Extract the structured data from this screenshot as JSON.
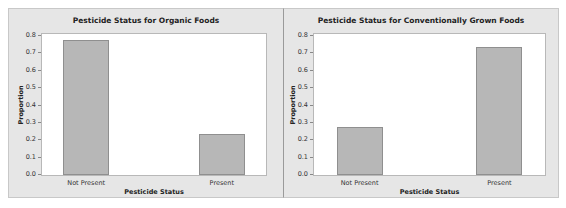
{
  "chart_data": [
    {
      "type": "bar",
      "title": "Pesticide Status for Organic Foods",
      "xlabel": "Pesticide Status",
      "ylabel": "Proportion",
      "categories": [
        "Not Present",
        "Present"
      ],
      "values": [
        0.77,
        0.23
      ],
      "ylim": [
        0.0,
        0.8
      ],
      "yticks": [
        "0.0",
        "0.1",
        "0.2",
        "0.3",
        "0.4",
        "0.5",
        "0.6",
        "0.7",
        "0.8"
      ],
      "grid": false,
      "legend": "none",
      "bar_color": "#b7b7b7"
    },
    {
      "type": "bar",
      "title": "Pesticide Status for Conventionally Grown Foods",
      "xlabel": "Pesticide Status",
      "ylabel": "Proportion",
      "categories": [
        "Not Present",
        "Present"
      ],
      "values": [
        0.27,
        0.73
      ],
      "ylim": [
        0.0,
        0.8
      ],
      "yticks": [
        "0.0",
        "0.1",
        "0.2",
        "0.3",
        "0.4",
        "0.5",
        "0.6",
        "0.7",
        "0.8"
      ],
      "grid": false,
      "legend": "none",
      "bar_color": "#b7b7b7"
    }
  ]
}
